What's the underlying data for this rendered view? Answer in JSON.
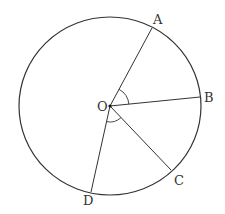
{
  "diagram": {
    "type": "circle-geometry",
    "circle": {
      "cx": 110,
      "cy": 106,
      "rx": 91,
      "ry": 89,
      "stroke": "#333333"
    },
    "center": {
      "label": "O",
      "x": 110,
      "y": 106,
      "label_x": 97,
      "label_y": 111
    },
    "points": [
      {
        "label": "A",
        "x": 152,
        "y": 28,
        "label_x": 153,
        "label_y": 24
      },
      {
        "label": "B",
        "x": 200,
        "y": 97,
        "label_x": 204,
        "label_y": 102
      },
      {
        "label": "C",
        "x": 171,
        "y": 170,
        "label_x": 174,
        "label_y": 185
      },
      {
        "label": "D",
        "x": 91,
        "y": 192,
        "label_x": 83,
        "label_y": 205
      }
    ],
    "segments": [
      "OA",
      "OB",
      "OC",
      "OD"
    ],
    "angle_marks": [
      {
        "between": "AOB",
        "vertex": "O"
      },
      {
        "between": "COD",
        "vertex": "O"
      }
    ]
  }
}
